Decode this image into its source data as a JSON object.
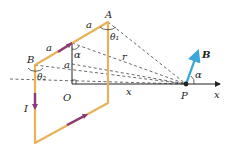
{
  "diagram": {
    "colors": {
      "loop": "#e8b25a",
      "current_arrow": "#8b3a7a",
      "axis": "#222222",
      "dashed": "#444444",
      "field_vector": "#3aa6d9"
    },
    "labels": {
      "A": "A",
      "B_point": "B",
      "O": "O",
      "P": "P",
      "x_axis": "x",
      "x_dist": "x",
      "r": "r",
      "I": "I",
      "a_top1": "a",
      "a_top2": "a",
      "a_vert": "a",
      "alpha_top": "α",
      "alpha_P": "α",
      "theta1": "θ₁",
      "theta2": "θ₂",
      "B_field": "B"
    }
  }
}
